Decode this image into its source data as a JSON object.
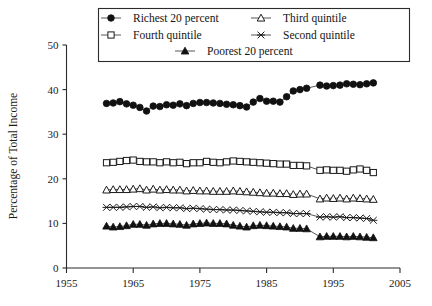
{
  "chart_data": {
    "type": "line",
    "title": "",
    "xlabel": "",
    "ylabel": "Percentage of Total Income",
    "xlim": [
      1955,
      2005
    ],
    "ylim": [
      0,
      50
    ],
    "xticks": [
      1955,
      1965,
      1975,
      1985,
      1995,
      2005
    ],
    "yticks": [
      0,
      10,
      20,
      30,
      40,
      50
    ],
    "grid": false,
    "legend_position": "top",
    "legend_entries": [
      "Richest 20 percent",
      "Third quintile",
      "Fourth quintile",
      "Second quintile",
      "Poorest 20 percent"
    ],
    "x": [
      1961,
      1962,
      1963,
      1964,
      1965,
      1966,
      1967,
      1968,
      1969,
      1970,
      1971,
      1972,
      1973,
      1974,
      1975,
      1976,
      1977,
      1978,
      1979,
      1980,
      1981,
      1982,
      1983,
      1984,
      1985,
      1986,
      1987,
      1988,
      1989,
      1990,
      1991,
      1993,
      1994,
      1995,
      1996,
      1997,
      1998,
      1999,
      2000,
      2001
    ],
    "series": [
      {
        "name": "Richest 20 percent",
        "marker": "filled-circle",
        "values": [
          36.9,
          37.0,
          37.3,
          36.8,
          36.5,
          36.0,
          35.2,
          36.3,
          36.2,
          36.6,
          36.5,
          36.8,
          36.4,
          36.9,
          37.1,
          37.1,
          37.0,
          36.9,
          36.7,
          36.6,
          36.4,
          36.1,
          37.2,
          38.0,
          37.4,
          37.4,
          37.2,
          38.4,
          39.7,
          40.0,
          40.3,
          41.0,
          40.8,
          40.9,
          41.0,
          41.3,
          41.2,
          41.1,
          41.3,
          41.5
        ]
      },
      {
        "name": "Fourth quintile",
        "marker": "open-square",
        "values": [
          23.6,
          23.7,
          23.9,
          24.1,
          24.2,
          23.9,
          23.8,
          23.8,
          23.6,
          23.8,
          23.6,
          23.7,
          23.4,
          23.6,
          23.6,
          23.9,
          23.7,
          23.6,
          23.8,
          24.0,
          23.9,
          23.8,
          23.7,
          23.6,
          23.5,
          23.4,
          23.3,
          23.3,
          23.0,
          23.0,
          22.9,
          21.9,
          22.0,
          21.9,
          21.9,
          21.7,
          22.0,
          22.2,
          21.9,
          21.4
        ]
      },
      {
        "name": "Third quintile",
        "marker": "open-triangle",
        "values": [
          17.5,
          17.6,
          17.6,
          17.6,
          17.7,
          17.8,
          17.5,
          17.7,
          17.5,
          17.6,
          17.5,
          17.5,
          17.3,
          17.4,
          17.3,
          17.3,
          17.2,
          17.2,
          17.2,
          17.3,
          17.2,
          17.1,
          17.0,
          16.9,
          16.8,
          16.8,
          16.7,
          16.7,
          16.5,
          16.6,
          16.6,
          15.5,
          15.7,
          15.6,
          15.7,
          15.5,
          15.7,
          15.6,
          15.5,
          15.4
        ]
      },
      {
        "name": "Second quintile",
        "marker": "cross",
        "values": [
          13.6,
          13.6,
          13.6,
          13.7,
          13.8,
          13.8,
          13.6,
          13.7,
          13.5,
          13.6,
          13.5,
          13.5,
          13.3,
          13.4,
          13.3,
          13.2,
          13.1,
          13.1,
          13.0,
          13.0,
          12.9,
          12.8,
          12.7,
          12.6,
          12.5,
          12.5,
          12.4,
          12.4,
          12.2,
          12.2,
          12.2,
          11.4,
          11.5,
          11.4,
          11.5,
          11.3,
          11.3,
          11.2,
          11.1,
          10.7
        ]
      },
      {
        "name": "Poorest 20 percent",
        "marker": "filled-triangle",
        "values": [
          9.4,
          9.2,
          9.3,
          9.5,
          9.8,
          9.8,
          9.6,
          9.9,
          10.0,
          10.0,
          9.9,
          9.8,
          9.6,
          9.9,
          10.0,
          10.1,
          10.0,
          10.0,
          9.9,
          9.6,
          9.4,
          9.2,
          9.5,
          9.6,
          9.5,
          9.4,
          9.3,
          9.2,
          8.9,
          8.9,
          8.8,
          7.0,
          7.1,
          7.1,
          7.1,
          7.0,
          7.1,
          7.0,
          6.9,
          6.8
        ]
      }
    ]
  },
  "axes": {
    "ylabel": "Percentage of Total Income",
    "ytick_labels": [
      "0",
      "10",
      "20",
      "30",
      "40",
      "50"
    ],
    "xtick_labels": [
      "1955",
      "1965",
      "1975",
      "1985",
      "1995",
      "2005"
    ]
  },
  "legend": {
    "items": [
      {
        "label": "Richest 20 percent",
        "marker": "filled-circle"
      },
      {
        "label": "Third quintile",
        "marker": "open-triangle"
      },
      {
        "label": "Fourth quintile",
        "marker": "open-square"
      },
      {
        "label": "Second quintile",
        "marker": "cross"
      },
      {
        "label": "Poorest 20 percent",
        "marker": "filled-triangle"
      }
    ]
  },
  "colors": {
    "ink": "#1a1a1a",
    "background": "#ffffff"
  }
}
